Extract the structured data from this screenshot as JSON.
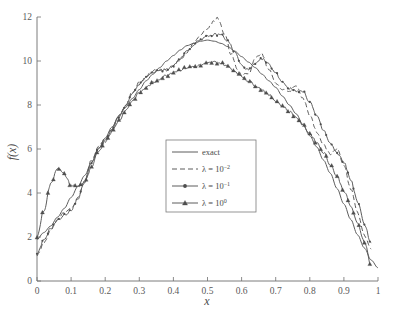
{
  "chart_data": {
    "type": "line",
    "title": "",
    "subtitle": "",
    "xlabel": "x",
    "ylabel": "f(x)",
    "xlim": [
      0,
      1
    ],
    "ylim": [
      0,
      12
    ],
    "xticks": [
      "0",
      "0.1",
      "0.2",
      "0.3",
      "0.4",
      "0.5",
      "0.6",
      "0.7",
      "0.8",
      "0.9",
      "1"
    ],
    "xtick_values": [
      0,
      0.1,
      0.2,
      0.3,
      0.4,
      0.5,
      0.6,
      0.7,
      0.8,
      0.9,
      1
    ],
    "yticks": [
      "0",
      "2",
      "4",
      "6",
      "8",
      "10",
      "12"
    ],
    "ytick_values": [
      0,
      2,
      4,
      6,
      8,
      10,
      12
    ],
    "grid": false,
    "legend_position": "center",
    "legend_entries": [
      {
        "label": "exact",
        "style": "solid",
        "marker": "none"
      },
      {
        "label": "λ = 10",
        "exponent": "−2",
        "style": "dashed",
        "marker": "none"
      },
      {
        "label": "λ = 10",
        "exponent": "−1",
        "style": "solid",
        "marker": "dot"
      },
      {
        "label": "λ = 10",
        "exponent": "0",
        "style": "solid",
        "marker": "triangle"
      }
    ],
    "series": [
      {
        "name": "exact",
        "style": "solid",
        "marker": "none",
        "x": [
          0.0,
          0.02,
          0.04,
          0.06,
          0.08,
          0.1,
          0.12,
          0.14,
          0.16,
          0.18,
          0.2,
          0.22,
          0.24,
          0.26,
          0.28,
          0.3,
          0.32,
          0.34,
          0.36,
          0.38,
          0.4,
          0.42,
          0.44,
          0.46,
          0.48,
          0.5,
          0.52,
          0.54,
          0.56,
          0.58,
          0.6,
          0.62,
          0.64,
          0.66,
          0.68,
          0.7,
          0.72,
          0.74,
          0.76,
          0.78,
          0.8,
          0.82,
          0.84,
          0.86,
          0.88,
          0.9,
          0.92,
          0.94,
          0.96,
          0.98,
          1.0
        ],
        "y": [
          1.9,
          2.2,
          2.5,
          2.9,
          3.3,
          3.8,
          4.3,
          4.8,
          5.4,
          6.0,
          6.5,
          7.0,
          7.5,
          7.9,
          8.3,
          8.7,
          9.1,
          9.4,
          9.7,
          10.0,
          10.25,
          10.5,
          10.7,
          10.8,
          10.9,
          10.95,
          10.9,
          10.8,
          10.65,
          10.45,
          10.2,
          9.95,
          9.7,
          9.4,
          9.1,
          8.8,
          8.4,
          8.0,
          7.6,
          7.1,
          6.6,
          6.1,
          5.5,
          4.9,
          4.2,
          3.5,
          2.8,
          2.1,
          1.5,
          0.95,
          0.6
        ]
      },
      {
        "name": "lambda = 10^-2",
        "style": "dashed",
        "marker": "none",
        "x": [
          0.0,
          0.02,
          0.04,
          0.06,
          0.08,
          0.1,
          0.12,
          0.14,
          0.16,
          0.18,
          0.2,
          0.22,
          0.24,
          0.26,
          0.28,
          0.3,
          0.32,
          0.34,
          0.36,
          0.38,
          0.4,
          0.42,
          0.44,
          0.46,
          0.48,
          0.5,
          0.52,
          0.53,
          0.55,
          0.57,
          0.59,
          0.6,
          0.62,
          0.64,
          0.66,
          0.68,
          0.7,
          0.72,
          0.74,
          0.76,
          0.78,
          0.8,
          0.82,
          0.84,
          0.86,
          0.88,
          0.9,
          0.92,
          0.94,
          0.96,
          0.98
        ],
        "y": [
          1.15,
          1.7,
          2.3,
          2.8,
          3.1,
          3.3,
          3.8,
          4.6,
          5.5,
          6.1,
          6.45,
          6.9,
          7.5,
          8.0,
          8.6,
          9.0,
          9.3,
          9.55,
          9.6,
          9.6,
          9.75,
          10.05,
          10.4,
          10.8,
          11.2,
          11.5,
          11.85,
          11.95,
          11.2,
          10.3,
          9.6,
          9.35,
          9.4,
          10.15,
          10.3,
          9.6,
          9.0,
          8.7,
          8.65,
          8.85,
          8.3,
          7.5,
          6.8,
          6.2,
          5.75,
          6.0,
          5.3,
          4.2,
          3.1,
          2.1,
          1.4
        ]
      },
      {
        "name": "lambda = 10^-1",
        "style": "solid",
        "marker": "dot",
        "x": [
          0.0,
          0.02,
          0.04,
          0.06,
          0.08,
          0.1,
          0.12,
          0.14,
          0.16,
          0.18,
          0.2,
          0.22,
          0.24,
          0.26,
          0.28,
          0.3,
          0.32,
          0.34,
          0.36,
          0.38,
          0.4,
          0.42,
          0.44,
          0.46,
          0.48,
          0.5,
          0.52,
          0.54,
          0.56,
          0.58,
          0.6,
          0.62,
          0.64,
          0.66,
          0.68,
          0.7,
          0.72,
          0.74,
          0.76,
          0.78,
          0.8,
          0.82,
          0.84,
          0.86,
          0.88,
          0.9,
          0.92,
          0.94,
          0.96,
          0.98
        ],
        "y": [
          1.2,
          1.85,
          2.4,
          2.75,
          3.0,
          3.2,
          3.75,
          4.5,
          5.4,
          6.0,
          6.4,
          6.9,
          7.45,
          7.95,
          8.5,
          8.95,
          9.25,
          9.5,
          9.55,
          9.6,
          9.8,
          10.1,
          10.45,
          10.75,
          11.0,
          11.1,
          11.2,
          11.2,
          10.9,
          10.4,
          9.8,
          9.6,
          9.85,
          10.1,
          9.85,
          9.45,
          9.05,
          8.75,
          8.65,
          8.6,
          8.15,
          7.5,
          6.85,
          6.25,
          5.8,
          5.4,
          4.6,
          3.6,
          2.6,
          1.7
        ]
      },
      {
        "name": "lambda = 10^0",
        "style": "solid",
        "marker": "triangle",
        "x": [
          0.0,
          0.02,
          0.04,
          0.06,
          0.08,
          0.1,
          0.12,
          0.14,
          0.16,
          0.18,
          0.2,
          0.22,
          0.24,
          0.26,
          0.28,
          0.3,
          0.32,
          0.34,
          0.36,
          0.38,
          0.4,
          0.42,
          0.44,
          0.46,
          0.48,
          0.5,
          0.52,
          0.54,
          0.56,
          0.58,
          0.6,
          0.62,
          0.64,
          0.66,
          0.68,
          0.7,
          0.72,
          0.74,
          0.76,
          0.78,
          0.8,
          0.82,
          0.84,
          0.86,
          0.88,
          0.9,
          0.92,
          0.94,
          0.96,
          0.98
        ],
        "y": [
          2.0,
          3.2,
          4.4,
          5.15,
          4.85,
          4.35,
          4.3,
          4.5,
          5.15,
          5.9,
          6.35,
          6.8,
          7.3,
          7.75,
          8.2,
          8.55,
          8.8,
          9.0,
          9.2,
          9.35,
          9.5,
          9.6,
          9.7,
          9.75,
          9.8,
          9.9,
          9.95,
          9.9,
          9.75,
          9.55,
          9.3,
          9.1,
          8.9,
          8.7,
          8.45,
          8.2,
          7.95,
          7.7,
          7.45,
          7.1,
          6.7,
          6.3,
          5.85,
          5.3,
          4.75,
          4.1,
          3.4,
          2.6,
          1.8,
          0.7
        ]
      }
    ]
  },
  "legend": {
    "entries": [
      {
        "text": "exact",
        "sup": ""
      },
      {
        "text": "λ = 10",
        "sup": "−2"
      },
      {
        "text": "λ = 10",
        "sup": "−1"
      },
      {
        "text": "λ = 10",
        "sup": "0"
      }
    ]
  },
  "axes": {
    "x_title": "x",
    "y_title": "f(x)"
  }
}
